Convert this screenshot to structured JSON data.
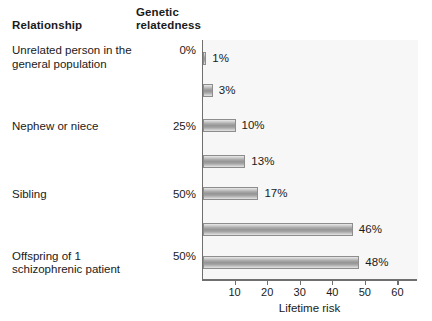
{
  "headers": {
    "relationship": "Relationship",
    "genetic_relatedness_line1": "Genetic",
    "genetic_relatedness_line2": "relatedness"
  },
  "rows": [
    {
      "label": "Unrelated person in the general population",
      "label_line1": "Unrelated person in the",
      "label_line2": "general population",
      "relatedness": "0%",
      "relatedness_line1": "0%",
      "relatedness_line2": "",
      "value": 1,
      "value_label": "1%"
    },
    {
      "label": "Nephew or niece",
      "label_line1": "Nephew or niece",
      "label_line2": "",
      "relatedness": "25%",
      "relatedness_line1": "25%",
      "relatedness_line2": "",
      "value": 3,
      "value_label": "3%"
    },
    {
      "label": "Sibling",
      "label_line1": "Sibling",
      "label_line2": "",
      "relatedness": "50%",
      "relatedness_line1": "50%",
      "relatedness_line2": "",
      "value": 10,
      "value_label": "10%"
    },
    {
      "label": "Offspring of 1 schizophrenic patient",
      "label_line1": "Offspring of 1",
      "label_line2": "schizophrenic patient",
      "relatedness": "50%",
      "relatedness_line1": "50%",
      "relatedness_line2": "",
      "value": 13,
      "value_label": "13%"
    },
    {
      "label": "Fraternal twin",
      "label_line1": "Fraternal twin",
      "label_line2": "",
      "relatedness": "50%",
      "relatedness_line1": "50%",
      "relatedness_line2": "",
      "value": 17,
      "value_label": "17%"
    },
    {
      "label": "Offspring of 2 schizophrenic patients",
      "label_line1": "Offspring of 2",
      "label_line2": "schizophrenic patients",
      "relatedness": "50% with each parent",
      "relatedness_line1": "50% with",
      "relatedness_line2": "each parent",
      "value": 46,
      "value_label": "46%"
    },
    {
      "label": "Identical twin",
      "label_line1": "Identical twin",
      "label_line2": "",
      "relatedness": "100%",
      "relatedness_line1": "100%",
      "relatedness_line2": "",
      "value": 48,
      "value_label": "48%"
    }
  ],
  "axis": {
    "title": "Lifetime risk",
    "ticks": [
      10,
      20,
      30,
      40,
      50,
      60
    ],
    "tick_labels": [
      "10",
      "20",
      "30",
      "40",
      "50",
      "60"
    ],
    "min": 0,
    "max": 66
  },
  "colors": {
    "bar_fill_mid": "#949494",
    "bar_fill_edge": "#e9e9e9",
    "bar_stroke": "#8d8d8d",
    "plot_background": "#f7f7f7",
    "axis": "#6f6f6f",
    "text": "#1a1a1a"
  },
  "chart_data": {
    "type": "bar",
    "orientation": "horizontal",
    "title": "",
    "subtitle": "",
    "xlabel": "Lifetime risk",
    "ylabel": "Relationship",
    "categories": [
      "Unrelated person in the general population",
      "Nephew or niece",
      "Sibling",
      "Offspring of 1 schizophrenic patient",
      "Fraternal twin",
      "Offspring of 2 schizophrenic patients",
      "Identical twin"
    ],
    "values": [
      1,
      3,
      10,
      13,
      17,
      46,
      48
    ],
    "data_labels": [
      "1%",
      "3%",
      "10%",
      "13%",
      "17%",
      "46%",
      "48%"
    ],
    "secondary_column": {
      "header": "Genetic relatedness",
      "values": [
        "0%",
        "25%",
        "50%",
        "50%",
        "50%",
        "50% with each parent",
        "100%"
      ]
    },
    "xlim": [
      0,
      66
    ],
    "xticks": [
      10,
      20,
      30,
      40,
      50,
      60
    ],
    "grid": false,
    "legend": "none"
  }
}
